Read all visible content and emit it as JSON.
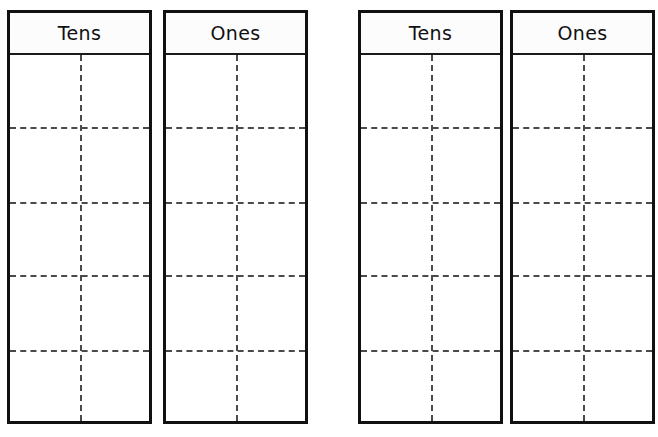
{
  "worksheet": {
    "title": "Tens and Ones Place Value Charts",
    "background_color": "#ffffff",
    "border_color": "#111111",
    "grid_line_color": "#4a4a4a",
    "header_background_color": "#fcfcfc",
    "text_color": "#111111",
    "chart_count": 4,
    "pair_count": 2
  },
  "charts": [
    {
      "id": "chart-1-tens",
      "label": "Tens",
      "pair": 1,
      "position": {
        "x": 7,
        "y": 10,
        "width": 145,
        "height": 414
      },
      "header_height": 42,
      "vertical_divider_fraction": 0.5,
      "row_line_offsets": [
        72,
        147,
        220,
        295
      ],
      "row_count": 5,
      "cells": [
        "",
        "",
        "",
        "",
        "",
        "",
        "",
        "",
        "",
        ""
      ]
    },
    {
      "id": "chart-1-ones",
      "label": "Ones",
      "pair": 1,
      "position": {
        "x": 163,
        "y": 10,
        "width": 145,
        "height": 414
      },
      "header_height": 42,
      "vertical_divider_fraction": 0.5,
      "row_line_offsets": [
        72,
        147,
        220,
        295
      ],
      "row_count": 5,
      "cells": [
        "",
        "",
        "",
        "",
        "",
        "",
        "",
        "",
        "",
        ""
      ]
    },
    {
      "id": "chart-2-tens",
      "label": "Tens",
      "pair": 2,
      "position": {
        "x": 358,
        "y": 10,
        "width": 145,
        "height": 414
      },
      "header_height": 42,
      "vertical_divider_fraction": 0.5,
      "row_line_offsets": [
        72,
        147,
        220,
        295
      ],
      "row_count": 5,
      "cells": [
        "",
        "",
        "",
        "",
        "",
        "",
        "",
        "",
        "",
        ""
      ]
    },
    {
      "id": "chart-2-ones",
      "label": "Ones",
      "pair": 2,
      "position": {
        "x": 510,
        "y": 10,
        "width": 145,
        "height": 414
      },
      "header_height": 42,
      "vertical_divider_fraction": 0.5,
      "row_line_offsets": [
        72,
        147,
        220,
        295
      ],
      "row_count": 5,
      "cells": [
        "",
        "",
        "",
        "",
        "",
        "",
        "",
        "",
        "",
        ""
      ]
    }
  ]
}
